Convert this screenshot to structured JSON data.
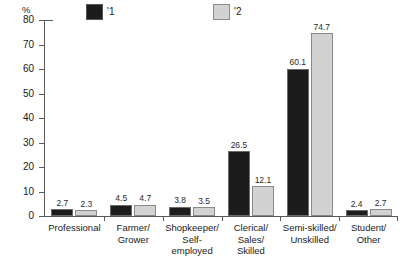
{
  "chart_data": {
    "type": "bar",
    "title": "",
    "subtitle": "",
    "xlabel": "",
    "ylabel": "%",
    "ylim": [
      0,
      80
    ],
    "yticks": [
      0,
      10,
      20,
      30,
      40,
      50,
      60,
      70,
      80
    ],
    "ytick_labels": [
      "0",
      "10",
      "20",
      "30",
      "40",
      "50",
      "60",
      "70",
      "80"
    ],
    "grid": false,
    "legend_position": "top",
    "categories": [
      "Professional",
      "Farmer/ Grower",
      "Shopkeeper/ Self-employed",
      "Clerical/ Sales/ Skilled",
      "Semi-skilled/ Unskilled",
      "Student/ Other"
    ],
    "category_lines": [
      [
        "Professional"
      ],
      [
        "Farmer/",
        "Grower"
      ],
      [
        "Shopkeeper/",
        "Self-employed"
      ],
      [
        "Clerical/",
        "Sales/",
        "Skilled"
      ],
      [
        "Semi-skilled/",
        "Unskilled"
      ],
      [
        "Student/",
        "Other"
      ]
    ],
    "series": [
      {
        "name": "'1",
        "color": "#1c1c1c",
        "values": [
          2.7,
          4.5,
          3.8,
          26.5,
          60.1,
          2.4
        ],
        "labels": [
          "2.7",
          "4.5",
          "3.8",
          "26.5",
          "60.1",
          "2.4"
        ]
      },
      {
        "name": "'2",
        "color": "#d2d2d2",
        "values": [
          2.3,
          4.7,
          3.5,
          12.1,
          74.7,
          2.7
        ],
        "labels": [
          "2.3",
          "4.7",
          "3.5",
          "12.1",
          "74.7",
          "2.7"
        ]
      }
    ]
  },
  "legend": {
    "items": [
      {
        "label": "'1",
        "swatch": "dark-square-swatch"
      },
      {
        "label": "'2",
        "swatch": "light-square-swatch"
      }
    ]
  },
  "axis": {
    "y_unit": "%"
  }
}
